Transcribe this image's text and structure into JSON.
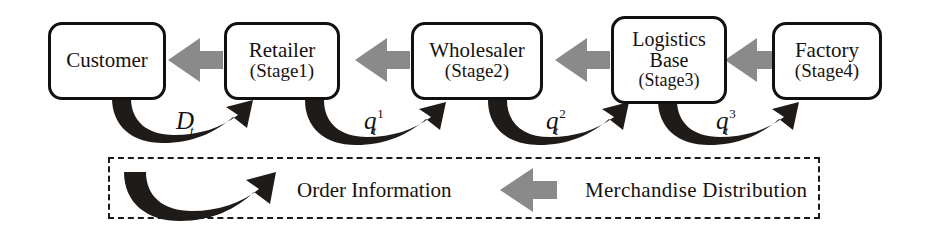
{
  "diagram": {
    "colors": {
      "box_border": "#111111",
      "box_fill": "#ffffff",
      "merchandise_arrow": "#8a8a8a",
      "order_arrow": "#1f1b18",
      "text": "#16120f",
      "legend_border": "#1a1a1a"
    },
    "nodes": [
      {
        "id": "customer",
        "line1": "Customer",
        "line2": "",
        "line3": "",
        "lines": 1
      },
      {
        "id": "retailer",
        "line1": "Retailer",
        "line2": "",
        "line3": "(Stage1)",
        "lines": 2
      },
      {
        "id": "wholesaler",
        "line1": "Wholesaler",
        "line2": "",
        "line3": "(Stage2)",
        "lines": 2
      },
      {
        "id": "logistics",
        "line1": "Logistics",
        "line2": "Base",
        "line3": "(Stage3)",
        "lines": 3
      },
      {
        "id": "factory",
        "line1": "Factory",
        "line2": "",
        "line3": "(Stage4)",
        "lines": 2
      }
    ],
    "flow_labels": [
      {
        "id": "demand",
        "base": "D",
        "sub": "t",
        "sup": ""
      },
      {
        "id": "order-1",
        "base": "q",
        "sub": "t",
        "sup": "1"
      },
      {
        "id": "order-2",
        "base": "q",
        "sub": "t",
        "sup": "2"
      },
      {
        "id": "order-3",
        "base": "q",
        "sub": "t",
        "sup": "3"
      }
    ],
    "legend": {
      "order_label": "Order Information",
      "merchandise_label": "Merchandise Distribution"
    }
  }
}
